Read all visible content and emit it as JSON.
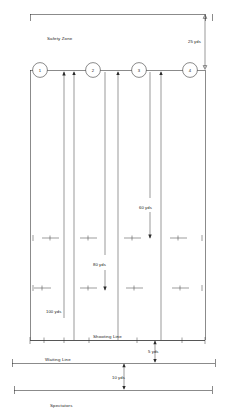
{
  "diagram": {
    "zones": {
      "safety_zone_label": "Safety Zone",
      "shooting_line_label": "Shooting Line",
      "waiting_line_label": "Waiting Line",
      "spectators_label": "Spectators"
    },
    "targets": [
      {
        "id": "1",
        "label": "1"
      },
      {
        "id": "2",
        "label": "2"
      },
      {
        "id": "3",
        "label": "3"
      },
      {
        "id": "4",
        "label": "4"
      }
    ],
    "dimensions": [
      {
        "id": "safety",
        "label": "25 yds",
        "orientation": "vertical"
      },
      {
        "id": "range-60",
        "label": "60 yds",
        "orientation": "vertical"
      },
      {
        "id": "range-80",
        "label": "80 yds",
        "orientation": "vertical"
      },
      {
        "id": "range-100",
        "label": "100 yds",
        "orientation": "vertical"
      },
      {
        "id": "shooting-to-waiting",
        "label": "5 yds",
        "orientation": "vertical"
      },
      {
        "id": "waiting-to-spectators",
        "label": "10 yds",
        "orientation": "vertical"
      }
    ],
    "colors": {
      "line": "#2b2b2b",
      "text": "#1a1a1a",
      "background": "#ffffff"
    }
  }
}
